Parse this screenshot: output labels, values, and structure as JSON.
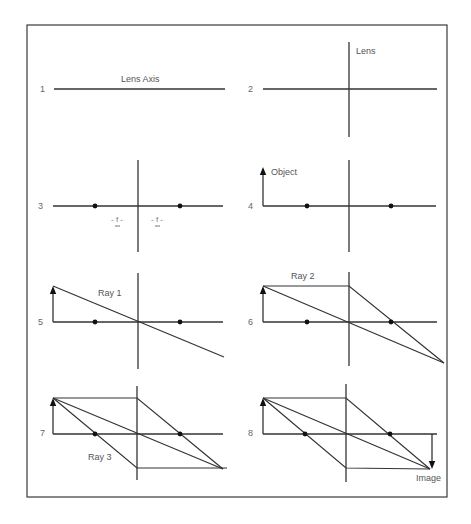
{
  "figure": {
    "frame": {
      "x": 27,
      "y": 25,
      "w": 420,
      "h": 472
    }
  },
  "labels": {
    "lens_axis": "Lens Axis",
    "lens": "Lens",
    "object": "Object",
    "ray1": "Ray 1",
    "ray2": "Ray 2",
    "ray3": "Ray 3",
    "image": "Image",
    "focal_left": "- f -",
    "focal_right": "- f -"
  },
  "panels": [
    {
      "num": "1",
      "num_pos": [
        40,
        92
      ],
      "axis": [
        54,
        89,
        225,
        89
      ]
    },
    {
      "num": "2",
      "num_pos": [
        248,
        92
      ],
      "axis": [
        263,
        89,
        437,
        89
      ],
      "lens": [
        349,
        42,
        349,
        137
      ]
    },
    {
      "num": "3",
      "num_pos": [
        38,
        209
      ],
      "axis": [
        53,
        206,
        223,
        206
      ],
      "lens": [
        138,
        160,
        138,
        252
      ],
      "dots": [
        [
          95,
          206
        ],
        [
          180,
          206
        ]
      ]
    },
    {
      "num": "4",
      "num_pos": [
        248,
        209
      ],
      "axis": [
        263,
        206,
        436,
        206
      ],
      "lens": [
        349,
        160,
        349,
        252
      ],
      "dots": [
        [
          307,
          206
        ],
        [
          391,
          206
        ]
      ],
      "object": [
        263,
        206,
        263,
        168
      ]
    },
    {
      "num": "5",
      "num_pos": [
        38,
        325
      ],
      "axis": [
        53,
        322,
        223,
        322
      ],
      "lens": [
        138,
        273,
        138,
        369
      ],
      "dots": [
        [
          95,
          322
        ],
        [
          180,
          322
        ]
      ],
      "object": [
        53,
        322,
        53,
        287
      ],
      "rays": [
        [
          [
            53,
            286
          ],
          [
            224,
            357
          ]
        ]
      ]
    },
    {
      "num": "6",
      "num_pos": [
        248,
        325
      ],
      "axis": [
        263,
        322,
        437,
        322
      ],
      "lens": [
        349,
        272,
        349,
        366
      ],
      "dots": [
        [
          307,
          322
        ],
        [
          391,
          322
        ]
      ],
      "object": [
        263,
        322,
        263,
        287
      ],
      "rays": [
        [
          [
            263,
            286
          ],
          [
            444,
            363
          ]
        ],
        [
          [
            263,
            286
          ],
          [
            349,
            286
          ],
          [
            444,
            363
          ]
        ]
      ]
    },
    {
      "num": "7",
      "num_pos": [
        40,
        436
      ],
      "axis": [
        53,
        434,
        223,
        434
      ],
      "lens": [
        137,
        386,
        137,
        480
      ],
      "dots": [
        [
          95,
          434
        ],
        [
          180,
          434
        ]
      ],
      "object": [
        53,
        434,
        53,
        399
      ],
      "rays": [
        [
          [
            53,
            398
          ],
          [
            137,
            398
          ],
          [
            223,
            469
          ]
        ],
        [
          [
            53,
            398
          ],
          [
            223,
            469
          ]
        ],
        [
          [
            53,
            398
          ],
          [
            137,
            468
          ],
          [
            227,
            468
          ]
        ]
      ]
    },
    {
      "num": "8",
      "num_pos": [
        248,
        436
      ],
      "axis": [
        263,
        434,
        437,
        434
      ],
      "lens": [
        346,
        384,
        346,
        482
      ],
      "dots": [
        [
          305,
          434
        ],
        [
          390,
          434
        ]
      ],
      "object": [
        263,
        434,
        263,
        399
      ],
      "rays": [
        [
          [
            263,
            398
          ],
          [
            346,
            398
          ],
          [
            430,
            469
          ]
        ],
        [
          [
            263,
            398
          ],
          [
            430,
            469
          ]
        ],
        [
          [
            263,
            398
          ],
          [
            346,
            468
          ],
          [
            430,
            469
          ]
        ]
      ],
      "image_arrow": [
        432,
        434,
        432,
        469
      ]
    }
  ]
}
